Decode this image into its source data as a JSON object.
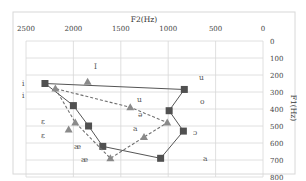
{
  "chart_data": {
    "type": "scatter",
    "title": "",
    "xlabel": "F2(Hz)",
    "ylabel": "F1(Hz)",
    "x_axis_position": "top",
    "x_reversed": true,
    "y_axis_position": "right",
    "y_reversed": true,
    "xlim": [
      2500,
      0
    ],
    "ylim": [
      0,
      800
    ],
    "x_ticks": [
      "2500",
      "2000",
      "1500",
      "1000",
      "500",
      "0"
    ],
    "y_ticks": [
      "0",
      "100",
      "200",
      "300",
      "400",
      "500",
      "600",
      "700",
      "800"
    ],
    "grid": true,
    "legend": null,
    "series": [
      {
        "name": "square-series",
        "marker": "square",
        "line": "solid",
        "points": [
          {
            "label": "i",
            "f2": 2300,
            "f1": 250
          },
          {
            "label": "e",
            "f2": 2000,
            "f1": 380
          },
          {
            "label": "ɛ",
            "f2": 1840,
            "f1": 500
          },
          {
            "label": "æ",
            "f2": 1690,
            "f1": 620
          },
          {
            "label": "a",
            "f2": 1080,
            "f1": 690
          },
          {
            "label": "ɔ",
            "f2": 840,
            "f1": 530
          },
          {
            "label": "o",
            "f2": 990,
            "f1": 410
          },
          {
            "label": "u",
            "f2": 830,
            "f1": 285
          },
          {
            "label": "i",
            "f2": 2300,
            "f1": 250
          }
        ]
      },
      {
        "name": "triangle-series",
        "marker": "triangle",
        "line": "dashed",
        "points": [
          {
            "label": "i",
            "f2": 2190,
            "f1": 280
          },
          {
            "label": "e",
            "f2": 1980,
            "f1": 480
          },
          {
            "label": "æ",
            "f2": 1610,
            "f1": 690
          },
          {
            "label": "a",
            "f2": 1255,
            "f1": 565
          },
          {
            "label": "ə",
            "f2": 1010,
            "f1": 480
          },
          {
            "label": "ʊ",
            "f2": 1400,
            "f1": 390
          },
          {
            "label": "i",
            "f2": 2190,
            "f1": 280
          }
        ],
        "extra_markers": [
          {
            "f2": 1850,
            "f1": 240
          },
          {
            "f2": 2050,
            "f1": 520
          }
        ]
      }
    ],
    "annotations": [
      {
        "text": "i",
        "x": 22,
        "y": 86
      },
      {
        "text": "i",
        "x": 22,
        "y": 98
      },
      {
        "text": "I",
        "x": 94,
        "y": 69
      },
      {
        "text": "u",
        "x": 137,
        "y": 102
      },
      {
        "text": "u",
        "x": 199,
        "y": 80
      },
      {
        "text": "o",
        "x": 200,
        "y": 104
      },
      {
        "text": "ə",
        "x": 138,
        "y": 117
      },
      {
        "text": "a",
        "x": 133,
        "y": 131
      },
      {
        "text": "ɔ",
        "x": 193,
        "y": 135
      },
      {
        "text": "a",
        "x": 203,
        "y": 161
      },
      {
        "text": "ɛ",
        "x": 41,
        "y": 124
      },
      {
        "text": "ɛ",
        "x": 41,
        "y": 138
      },
      {
        "text": "æ",
        "x": 74,
        "y": 149
      },
      {
        "text": "æ",
        "x": 81,
        "y": 162
      }
    ]
  },
  "colors": {
    "square_line": "#555555",
    "square_marker": "#505050",
    "triangle_line": "#707070",
    "triangle_marker": "#8a8a8a",
    "grid": "#d8d8d8",
    "frame": "#d0d0d0"
  }
}
